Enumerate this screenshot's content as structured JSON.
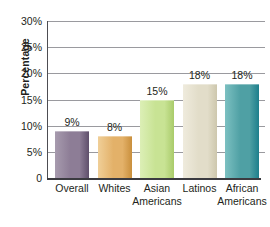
{
  "chart_data": {
    "type": "bar",
    "title": "",
    "subtitle": "",
    "xlabel": "",
    "ylabel": "Percentage",
    "categories": [
      "Overall",
      "Whites",
      "Asian Americans",
      "Latinos",
      "African Americans"
    ],
    "category_lines": [
      [
        "Overall",
        ""
      ],
      [
        "Whites",
        ""
      ],
      [
        "Asian",
        "Americans"
      ],
      [
        "Latinos",
        ""
      ],
      [
        "African",
        "Americans"
      ]
    ],
    "values": [
      9,
      8,
      15,
      18,
      18
    ],
    "value_labels": [
      "9%",
      "8%",
      "15%",
      "18%",
      "18%"
    ],
    "ylim": [
      0,
      30
    ],
    "ytick_values": [
      0,
      5,
      10,
      15,
      20,
      25,
      30
    ],
    "ytick_labels": [
      "0",
      "5%",
      "10%",
      "15%",
      "20%",
      "25%",
      "30%"
    ],
    "grid": "horizontal",
    "legend": "none",
    "bar_colors": [
      "#8d7d96",
      "#e3b169",
      "#c8e394",
      "#e2ddc9",
      "#4fa0a4"
    ],
    "bar_colors_light": [
      "#a79bae",
      "#f0cf98",
      "#dcefb6",
      "#efebdd",
      "#7cc0c1"
    ],
    "bar_edge_colors": [
      "#5f4f6b",
      "#c98f3c",
      "#a9cb6a",
      "#cdc7ad",
      "#1d7f8c"
    ],
    "axis_color": "#3b3b40",
    "grid_color": "#9a9a9f",
    "text_color": "#231f20"
  }
}
